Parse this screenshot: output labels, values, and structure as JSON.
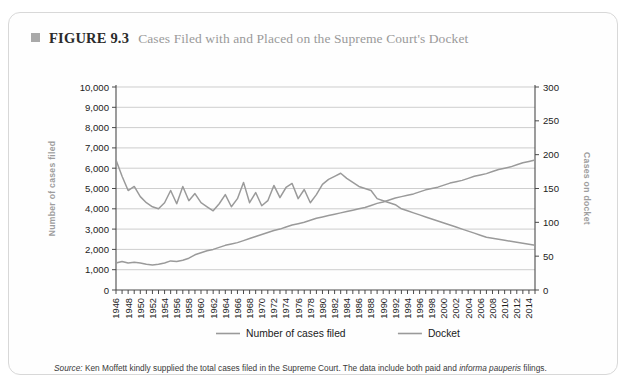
{
  "figure": {
    "marker_icon": "square-marker-icon",
    "number_label": "FIGURE 9.3",
    "title": "Cases Filed with and Placed on the Supreme Court's Docket"
  },
  "source": {
    "label": "Source:",
    "text_before_italic": " Ken Moffett kindly supplied the total cases filed in the Supreme Court. The data include both paid and ",
    "italic_phrase": "informa pauperis",
    "text_after_italic": " filings."
  },
  "chart_data": {
    "type": "line",
    "title": "Cases Filed with and Placed on the Supreme Court's Docket",
    "xlabel": "",
    "ylabel": "Number of cases filed",
    "y2label": "Cases on docket",
    "xlim": [
      1946,
      2015
    ],
    "ylim": [
      0,
      10000
    ],
    "y2lim": [
      0,
      300
    ],
    "grid": true,
    "legend_position": "bottom-center",
    "y_ticks": [
      "0",
      "1,000",
      "2,000",
      "3,000",
      "4,000",
      "5,000",
      "6,000",
      "7,000",
      "8,000",
      "9,000",
      "10,000"
    ],
    "y_tick_values": [
      0,
      1000,
      2000,
      3000,
      4000,
      5000,
      6000,
      7000,
      8000,
      9000,
      10000
    ],
    "y2_ticks": [
      "0",
      "50",
      "100",
      "150",
      "200",
      "250",
      "300"
    ],
    "y2_tick_values": [
      0,
      50,
      100,
      150,
      200,
      250,
      300
    ],
    "x_tick_labels": [
      "1946",
      "1948",
      "1950",
      "1952",
      "1954",
      "1956",
      "1958",
      "1960",
      "1962",
      "1964",
      "1966",
      "1968",
      "1970",
      "1972",
      "1974",
      "1976",
      "1978",
      "1980",
      "1982",
      "1984",
      "1986",
      "1988",
      "1990",
      "1992",
      "1994",
      "1996",
      "1998",
      "2000",
      "2002",
      "2004",
      "2006",
      "2008",
      "2010",
      "2012",
      "2014"
    ],
    "x": [
      1946,
      1947,
      1948,
      1949,
      1950,
      1951,
      1952,
      1953,
      1954,
      1955,
      1956,
      1957,
      1958,
      1959,
      1960,
      1961,
      1962,
      1963,
      1964,
      1965,
      1966,
      1967,
      1968,
      1969,
      1970,
      1971,
      1972,
      1973,
      1974,
      1975,
      1976,
      1977,
      1978,
      1979,
      1980,
      1981,
      1982,
      1983,
      1984,
      1985,
      1986,
      1987,
      1988,
      1989,
      1990,
      1991,
      1992,
      1993,
      1994,
      1995,
      1996,
      1997,
      1998,
      1999,
      2000,
      2001,
      2002,
      2003,
      2004,
      2005,
      2006,
      2007,
      2008,
      2009,
      2010,
      2011,
      2012,
      2013,
      2014,
      2015
    ],
    "series": [
      {
        "name": "Number of cases filed",
        "axis": "left",
        "units": "cases",
        "values": [
          6400,
          5600,
          4900,
          5100,
          4600,
          4300,
          4100,
          4000,
          4200,
          4900,
          4300,
          4500,
          4700,
          5500,
          5200,
          5400,
          5700,
          6100,
          6500,
          6300,
          6900,
          7000,
          6800,
          7100,
          7000,
          6700,
          7200,
          7300,
          7000,
          6900,
          7100,
          7300,
          7400,
          7200,
          7100,
          7000,
          7200,
          7100,
          7000,
          6800,
          6500,
          6400,
          6300,
          6200,
          6100,
          5900,
          5800,
          5700,
          5600,
          5500,
          5400,
          5300,
          5200,
          5100,
          5000,
          5100,
          5200,
          5300,
          5400,
          5500,
          5600,
          5700,
          5800,
          5900,
          6000,
          6100,
          6200,
          6300,
          6400,
          6500
        ]
      },
      {
        "name": "Docket",
        "axis": "right",
        "units": "cases on docket",
        "values": [
          38,
          40,
          38,
          39,
          38,
          37,
          36,
          37,
          39,
          42,
          40,
          41,
          43,
          48,
          50,
          53,
          55,
          58,
          60,
          62,
          64,
          66,
          68,
          70,
          72,
          74,
          76,
          78,
          80,
          82,
          84,
          86,
          88,
          90,
          92,
          94,
          96,
          98,
          100,
          102,
          104,
          106,
          108,
          110,
          112,
          114,
          116,
          118,
          120,
          122,
          124,
          126,
          128,
          130,
          132,
          134,
          136,
          138,
          140,
          142,
          144,
          146,
          148,
          150,
          152,
          154,
          156,
          158,
          160,
          162
        ]
      }
    ],
    "legend": [
      {
        "label": "Number of cases filed"
      },
      {
        "label": "Docket"
      }
    ]
  },
  "filed_series_actual": [
    6400,
    5600,
    4900,
    5100,
    4600,
    4300,
    4100,
    4000,
    4300,
    4900,
    4250,
    5100,
    4400,
    4750,
    4300,
    4100,
    3900,
    4250,
    4700,
    4100,
    4500,
    5300,
    4300,
    4800,
    4150,
    4400,
    5150,
    4550,
    5050,
    5250,
    4500,
    4950,
    4300,
    4700,
    5200,
    5450,
    5600,
    5750,
    5500,
    5300,
    5100,
    5000,
    4900,
    4500,
    4400,
    4300,
    4200,
    4000,
    3900,
    3800,
    3700,
    3600,
    3500,
    3400,
    3300,
    3200,
    3100,
    3000,
    2900,
    2800,
    2700,
    2600,
    2550,
    2500,
    2450,
    2400,
    2350,
    2300,
    2250,
    2200
  ],
  "docket_series_actual": [
    40,
    42,
    40,
    41,
    40,
    38,
    37,
    38,
    40,
    43,
    42,
    44,
    47,
    52,
    55,
    58,
    60,
    63,
    66,
    68,
    70,
    73,
    76,
    79,
    82,
    85,
    88,
    90,
    93,
    96,
    98,
    100,
    103,
    106,
    108,
    110,
    112,
    114,
    116,
    118,
    120,
    122,
    125,
    128,
    130,
    133,
    136,
    138,
    140,
    142,
    145,
    148,
    150,
    152,
    155,
    158,
    160,
    162,
    165,
    168,
    170,
    172,
    175,
    178,
    180,
    182,
    185,
    188,
    190,
    192
  ]
}
